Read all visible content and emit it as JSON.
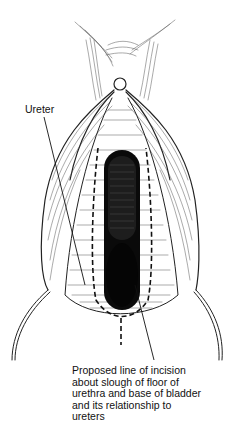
{
  "figure": {
    "type": "surgical line illustration",
    "stroke_color": "#111111",
    "background": "#ffffff"
  },
  "labels": {
    "ureter": "Ureter",
    "incision": {
      "lines": [
        "Proposed line of incision",
        "about slough of floor of",
        "urethra and base of bladder",
        "and its relationship to",
        "ureters"
      ]
    }
  }
}
